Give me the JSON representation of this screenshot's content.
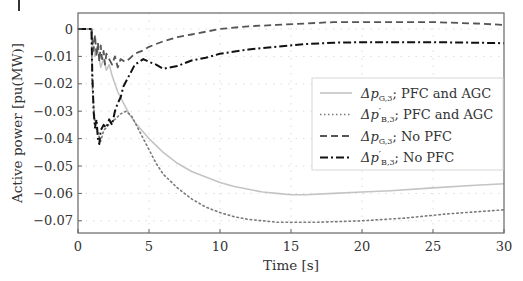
{
  "chart_data": {
    "type": "line",
    "title": "",
    "xlabel": "Time [s]",
    "ylabel": "Active power [pu(MW)]",
    "xlim": [
      0,
      30
    ],
    "ylim": [
      -0.075,
      0.005
    ],
    "xticks": [
      0,
      5,
      10,
      15,
      20,
      25,
      30
    ],
    "xtick_labels": [
      "0",
      "5",
      "10",
      "15",
      "20",
      "25",
      "30"
    ],
    "yticks": [
      0,
      -0.01,
      -0.02,
      -0.03,
      -0.04,
      -0.05,
      -0.06,
      -0.07
    ],
    "ytick_labels": [
      "0",
      "−0.01",
      "−0.02",
      "−0.03",
      "−0.04",
      "−0.05",
      "−0.06",
      "−0.07"
    ],
    "grid": true,
    "legend_position": "center right",
    "series": [
      {
        "name": "Δp_G,3; PFC and AGC",
        "legend_main": "Δp",
        "legend_sub": "G,3",
        "legend_prime": "",
        "legend_suffix": "; PFC and AGC",
        "style": "solid",
        "color": "#c4c4c4",
        "width": 1.6,
        "x": [
          0,
          0.95,
          1.0,
          1.2,
          1.4,
          1.6,
          1.8,
          2.0,
          2.2,
          2.4,
          2.6,
          2.8,
          3.0,
          3.3,
          3.6,
          4.0,
          4.5,
          5.0,
          6.0,
          7.0,
          8.0,
          9.0,
          10.0,
          11.0,
          12.0,
          13.0,
          14.0,
          15.0,
          16.0,
          18.0,
          20.0,
          22.0,
          25.0,
          28.0,
          30.0
        ],
        "y": [
          0,
          0,
          -0.005,
          -0.01,
          -0.008,
          -0.014,
          -0.011,
          -0.015,
          -0.013,
          -0.017,
          -0.02,
          -0.023,
          -0.025,
          -0.028,
          -0.031,
          -0.034,
          -0.037,
          -0.04,
          -0.045,
          -0.049,
          -0.052,
          -0.054,
          -0.056,
          -0.0575,
          -0.0585,
          -0.0595,
          -0.06,
          -0.0605,
          -0.0605,
          -0.06,
          -0.0595,
          -0.059,
          -0.058,
          -0.057,
          -0.0565
        ]
      },
      {
        "name": "Δp'_B,3; PFC and AGC",
        "legend_main": "Δp",
        "legend_sub": "B,3",
        "legend_prime": "′",
        "legend_suffix": "; PFC and AGC",
        "style": "dotted",
        "color": "#7a7a7a",
        "width": 1.6,
        "x": [
          0,
          0.95,
          1.0,
          1.2,
          1.4,
          1.6,
          1.8,
          2.0,
          2.3,
          2.6,
          3.0,
          3.4,
          3.8,
          4.2,
          4.6,
          5.0,
          5.5,
          6.0,
          7.0,
          8.0,
          9.0,
          10.0,
          11.0,
          12.0,
          13.0,
          14.0,
          15.0,
          17.0,
          20.0,
          23.0,
          26.0,
          30.0
        ],
        "y": [
          0,
          0,
          -0.02,
          -0.035,
          -0.038,
          -0.041,
          -0.037,
          -0.036,
          -0.034,
          -0.033,
          -0.031,
          -0.03,
          -0.032,
          -0.036,
          -0.04,
          -0.044,
          -0.049,
          -0.053,
          -0.058,
          -0.062,
          -0.065,
          -0.067,
          -0.0685,
          -0.0695,
          -0.07,
          -0.0705,
          -0.0705,
          -0.0705,
          -0.07,
          -0.069,
          -0.0675,
          -0.066
        ]
      },
      {
        "name": "Δp_G,3; No PFC",
        "legend_main": "Δp",
        "legend_sub": "G,3",
        "legend_prime": "",
        "legend_suffix": "; No PFC",
        "style": "dashed",
        "color": "#555555",
        "width": 1.8,
        "x": [
          0,
          0.95,
          1.0,
          1.1,
          1.2,
          1.3,
          1.4,
          1.5,
          1.6,
          1.7,
          1.8,
          1.9,
          2.0,
          2.2,
          2.4,
          2.6,
          2.8,
          3.0,
          3.3,
          3.6,
          4.0,
          4.5,
          5.0,
          6.0,
          7.0,
          8.0,
          9.0,
          10.0,
          12.0,
          14.0,
          16.0,
          18.0,
          20.0,
          22.0,
          25.0,
          28.0,
          30.0
        ],
        "y": [
          0,
          0,
          -0.003,
          -0.008,
          -0.002,
          -0.01,
          -0.005,
          -0.012,
          -0.006,
          -0.011,
          -0.008,
          -0.013,
          -0.009,
          -0.011,
          -0.013,
          -0.01,
          -0.014,
          -0.011,
          -0.012,
          -0.011,
          -0.009,
          -0.008,
          -0.0065,
          -0.0045,
          -0.003,
          -0.002,
          -0.001,
          0.0,
          0.001,
          0.0015,
          0.002,
          0.0025,
          0.0025,
          0.0025,
          0.0025,
          0.002,
          0.0015
        ]
      },
      {
        "name": "Δp'_B,3; No PFC",
        "legend_main": "Δp",
        "legend_sub": "B,3",
        "legend_prime": "′",
        "legend_suffix": "; No PFC",
        "style": "dashdot",
        "color": "#111111",
        "width": 2.0,
        "x": [
          0,
          0.95,
          1.0,
          1.1,
          1.2,
          1.3,
          1.4,
          1.5,
          1.6,
          1.8,
          2.0,
          2.2,
          2.4,
          2.6,
          2.8,
          3.0,
          3.2,
          3.5,
          3.8,
          4.0,
          4.3,
          4.6,
          5.0,
          5.5,
          6.0,
          7.0,
          8.0,
          9.0,
          10.0,
          12.0,
          14.0,
          16.0,
          18.0,
          20.0,
          22.0,
          25.0,
          28.0,
          30.0
        ],
        "y": [
          0,
          0,
          -0.015,
          -0.03,
          -0.036,
          -0.033,
          -0.04,
          -0.042,
          -0.037,
          -0.035,
          -0.036,
          -0.033,
          -0.035,
          -0.03,
          -0.027,
          -0.025,
          -0.021,
          -0.018,
          -0.015,
          -0.013,
          -0.012,
          -0.011,
          -0.012,
          -0.013,
          -0.0145,
          -0.0135,
          -0.0115,
          -0.0105,
          -0.009,
          -0.0075,
          -0.0065,
          -0.0055,
          -0.005,
          -0.0048,
          -0.0048,
          -0.0048,
          -0.005,
          -0.0052
        ]
      }
    ]
  }
}
